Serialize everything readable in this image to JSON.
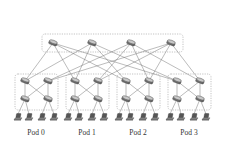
{
  "diagram": {
    "type": "fat-tree network topology",
    "colors": {
      "background": "#ffffff",
      "link": "#6a6a6a",
      "box_border": "#9a9a9a",
      "switch_body": "#6e6e6e",
      "switch_top": "#c8c8c8",
      "label": "#333333"
    },
    "core_layer": {
      "box": {
        "x": 42,
        "y": 34,
        "w": 141,
        "h": 18
      },
      "switches": [
        {
          "id": "core-0",
          "x": 53,
          "y": 43
        },
        {
          "id": "core-1",
          "x": 92,
          "y": 43
        },
        {
          "id": "core-2",
          "x": 131,
          "y": 43
        },
        {
          "id": "core-3",
          "x": 171,
          "y": 43
        }
      ]
    },
    "pods": [
      {
        "label": "Pod 0",
        "label_x": 36,
        "box": {
          "x": 15,
          "y": 74,
          "w": 43,
          "h": 36
        },
        "aggregation": [
          {
            "x": 25,
            "y": 81
          },
          {
            "x": 48,
            "y": 81
          }
        ],
        "edge": [
          {
            "x": 25,
            "y": 99
          },
          {
            "x": 48,
            "y": 99
          }
        ],
        "hosts": [
          {
            "x": 18
          },
          {
            "x": 29
          },
          {
            "x": 42
          },
          {
            "x": 54
          }
        ]
      },
      {
        "label": "Pod 1",
        "label_x": 87,
        "box": {
          "x": 66,
          "y": 74,
          "w": 43,
          "h": 36
        },
        "aggregation": [
          {
            "x": 75,
            "y": 81
          },
          {
            "x": 98,
            "y": 81
          }
        ],
        "edge": [
          {
            "x": 75,
            "y": 99
          },
          {
            "x": 98,
            "y": 99
          }
        ],
        "hosts": [
          {
            "x": 68
          },
          {
            "x": 79
          },
          {
            "x": 92
          },
          {
            "x": 104
          }
        ]
      },
      {
        "label": "Pod 2",
        "label_x": 138,
        "box": {
          "x": 117,
          "y": 74,
          "w": 43,
          "h": 36
        },
        "aggregation": [
          {
            "x": 126,
            "y": 81
          },
          {
            "x": 149,
            "y": 81
          }
        ],
        "edge": [
          {
            "x": 126,
            "y": 99
          },
          {
            "x": 149,
            "y": 99
          }
        ],
        "hosts": [
          {
            "x": 119
          },
          {
            "x": 130
          },
          {
            "x": 143
          },
          {
            "x": 155
          }
        ]
      },
      {
        "label": "Pod 3",
        "label_x": 189,
        "box": {
          "x": 168,
          "y": 74,
          "w": 43,
          "h": 36
        },
        "aggregation": [
          {
            "x": 177,
            "y": 81
          },
          {
            "x": 200,
            "y": 81
          }
        ],
        "edge": [
          {
            "x": 177,
            "y": 99
          },
          {
            "x": 200,
            "y": 99
          }
        ],
        "hosts": [
          {
            "x": 170
          },
          {
            "x": 181
          },
          {
            "x": 194
          },
          {
            "x": 206
          }
        ]
      }
    ],
    "host_y": 118,
    "label_y": 135,
    "core_to_agg_rule": "core 0,1 connect to agg 0 of each pod; core 2,3 connect to agg 1 of each pod"
  }
}
